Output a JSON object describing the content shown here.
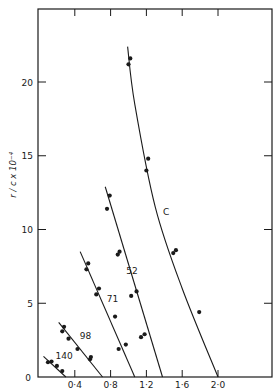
{
  "chart_data": {
    "type": "scatter",
    "title": "",
    "xlabel": "",
    "ylabel": "r / c x 10⁻⁴",
    "xlim": [
      0,
      2.6
    ],
    "ylim": [
      0,
      25
    ],
    "x_ticks": [
      "0·4",
      "0·8",
      "1·2",
      "1·6",
      "2·0"
    ],
    "x_tick_values": [
      0.4,
      0.8,
      1.2,
      1.6,
      2.0
    ],
    "y_ticks": [
      "0",
      "5",
      "10",
      "15",
      "20"
    ],
    "y_tick_values": [
      0,
      5,
      10,
      15,
      20
    ],
    "grid": false,
    "legend": "inline curve labels",
    "series": [
      {
        "name": "140",
        "points": [
          [
            0.1,
            1.0
          ],
          [
            0.14,
            1.05
          ],
          [
            0.2,
            0.75
          ],
          [
            0.26,
            0.4
          ]
        ],
        "line": [
          [
            0.05,
            1.4
          ],
          [
            0.3,
            0.0
          ]
        ],
        "label_pos": [
          0.28,
          1.2
        ]
      },
      {
        "name": "98",
        "points": [
          [
            0.26,
            3.1
          ],
          [
            0.28,
            3.4
          ],
          [
            0.33,
            2.6
          ],
          [
            0.43,
            1.9
          ],
          [
            0.57,
            1.2
          ],
          [
            0.58,
            1.35
          ]
        ],
        "line": [
          [
            0.22,
            3.7
          ],
          [
            0.71,
            0.0
          ]
        ],
        "label_pos": [
          0.52,
          2.6
        ]
      },
      {
        "name": "71",
        "points": [
          [
            0.53,
            7.3
          ],
          [
            0.55,
            7.7
          ],
          [
            0.64,
            5.6
          ],
          [
            0.67,
            6.0
          ],
          [
            0.85,
            4.1
          ],
          [
            0.89,
            1.9
          ],
          [
            0.97,
            2.2
          ]
        ],
        "line": [
          [
            0.46,
            8.5
          ],
          [
            1.07,
            0.0
          ]
        ],
        "label_pos": [
          0.82,
          5.1
        ]
      },
      {
        "name": "52",
        "points": [
          [
            0.76,
            11.4
          ],
          [
            0.79,
            12.3
          ],
          [
            0.88,
            8.3
          ],
          [
            0.9,
            8.5
          ],
          [
            1.03,
            5.5
          ],
          [
            1.09,
            5.8
          ],
          [
            1.14,
            2.7
          ],
          [
            1.18,
            2.9
          ]
        ],
        "line": [
          [
            0.74,
            12.9
          ],
          [
            1.38,
            0.0
          ]
        ],
        "label_pos": [
          1.04,
          7.0
        ]
      },
      {
        "name": "C",
        "points": [
          [
            1.0,
            21.2
          ],
          [
            1.02,
            21.6
          ],
          [
            1.2,
            14.0
          ],
          [
            1.22,
            14.8
          ],
          [
            1.5,
            8.4
          ],
          [
            1.53,
            8.6
          ],
          [
            1.79,
            4.4
          ]
        ],
        "line": [
          [
            0.99,
            22.4
          ],
          [
            1.07,
            18.5
          ],
          [
            1.3,
            11.5
          ],
          [
            1.6,
            6.0
          ],
          [
            2.0,
            0.0
          ]
        ],
        "label_pos": [
          1.42,
          11.0
        ]
      }
    ]
  },
  "axes": {
    "y_label": "r / c x 10⁻⁴",
    "x_tick_labels": [
      "0·4",
      "0·8",
      "1·2",
      "1·6",
      "2·0"
    ],
    "y_tick_labels": [
      "0",
      "5",
      "10",
      "15",
      "20"
    ],
    "origin_label": "0"
  },
  "curve_labels": [
    "140",
    "98",
    "71",
    "52",
    "C"
  ]
}
